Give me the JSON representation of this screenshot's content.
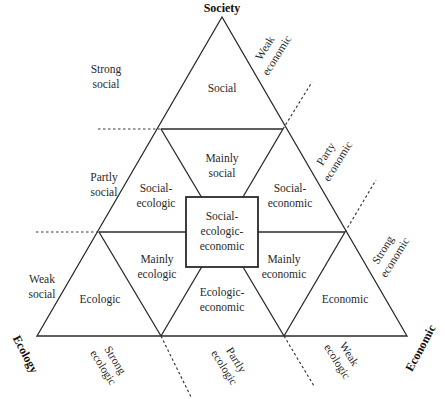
{
  "vertices": {
    "top": "Society",
    "left": "Ecology",
    "right": "Economic"
  },
  "regions": {
    "social": "Social",
    "mainly_social": [
      "Mainly",
      "social"
    ],
    "social_ecologic": [
      "Social-",
      "ecologic"
    ],
    "social_economic": [
      "Social-",
      "economic"
    ],
    "center": [
      "Social-",
      "ecologic-",
      "economic"
    ],
    "mainly_ecologic": [
      "Mainly",
      "ecologic"
    ],
    "mainly_economic": [
      "Mainly",
      "economic"
    ],
    "ecologic": "Ecologic",
    "ecologic_economic": [
      "Ecologic-",
      "economic"
    ],
    "economic": "Economic"
  },
  "side_labels": {
    "left": [
      [
        "Strong",
        "social"
      ],
      [
        "Partly",
        "social"
      ],
      [
        "Weak",
        "social"
      ]
    ],
    "right": [
      [
        "Weak",
        "economic"
      ],
      [
        "Party",
        "economic"
      ],
      [
        "Strong",
        "economic"
      ]
    ],
    "bottom": [
      [
        "Strong",
        "ecologic"
      ],
      [
        "Partly",
        "ecologic"
      ],
      [
        "Weak",
        "ecologic"
      ]
    ]
  }
}
